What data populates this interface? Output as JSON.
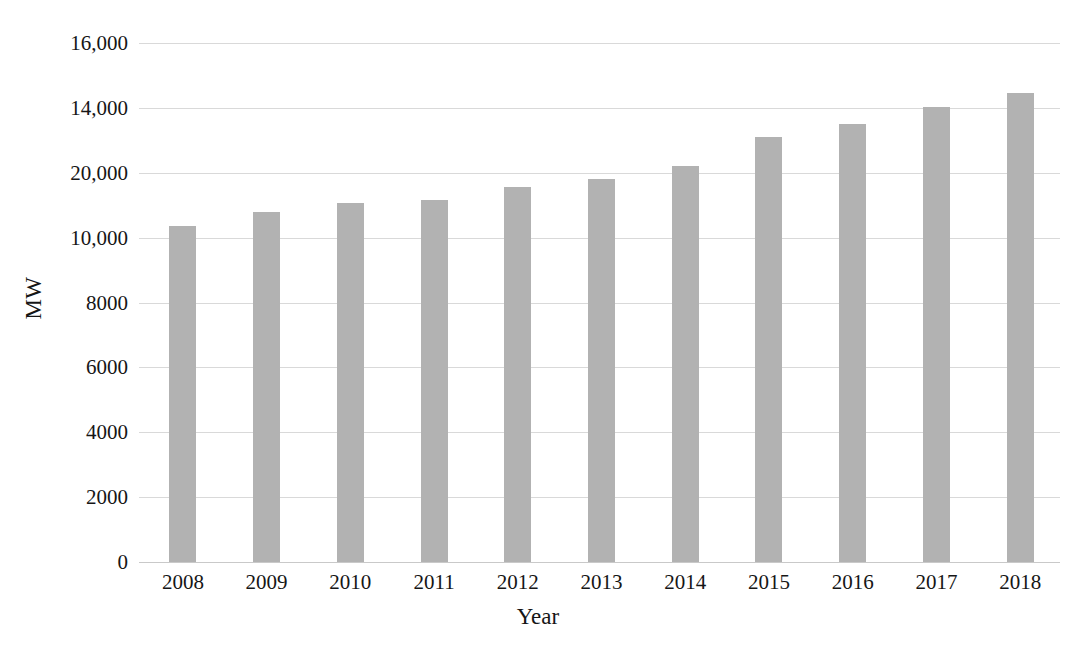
{
  "chart_data": {
    "type": "bar",
    "title": "",
    "xlabel": "Year",
    "ylabel": "MW",
    "categories": [
      "2008",
      "2009",
      "2010",
      "2011",
      "2012",
      "2013",
      "2014",
      "2015",
      "2016",
      "2017",
      "2018"
    ],
    "values": [
      10350,
      10780,
      11060,
      11150,
      11550,
      11800,
      12200,
      13100,
      13500,
      14020,
      14450
    ],
    "series": [
      {
        "name": "Installed capacity",
        "values": [
          10350,
          10780,
          11060,
          11150,
          11550,
          11800,
          12200,
          13100,
          13500,
          14020,
          14450
        ]
      }
    ],
    "ytick_labels": [
      "16,000",
      "14,000",
      "20,000",
      "10,000",
      "8000",
      "6000",
      "4000",
      "2000",
      "0"
    ],
    "ytick_positions": [
      16000,
      14000,
      12000,
      10000,
      8000,
      6000,
      4000,
      2000,
      0
    ],
    "ylim": [
      0,
      16000
    ],
    "grid": "horizontal",
    "legend": "none",
    "bar_color": "#b2b2b2",
    "gridline_color": "#d9d9d9",
    "text_color": "#161616"
  }
}
